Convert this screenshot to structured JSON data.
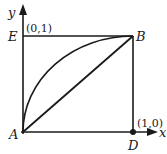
{
  "diagram": {
    "axes": {
      "x_label": "x",
      "y_label": "y"
    },
    "points": {
      "A": {
        "label": "A",
        "coord": null
      },
      "B": {
        "label": "B",
        "coord": null
      },
      "D": {
        "label": "D",
        "coord_label": "(1,0)"
      },
      "E": {
        "label": "E",
        "coord_label": "(0,1)"
      }
    },
    "elements": [
      "square ABDE with sides along axes",
      "diagonal line from A to B",
      "quarter-circle arc from A to B bulging toward E",
      "filled dot at D"
    ],
    "colors": {
      "stroke": "#1a1a1a",
      "background": "#ffffff"
    }
  }
}
